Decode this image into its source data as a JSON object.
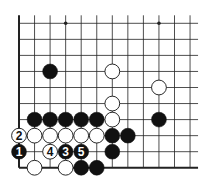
{
  "diagram": {
    "type": "go-board-fragment",
    "cols": 12,
    "rows": 10,
    "edges": {
      "left": true,
      "bottom": true,
      "top": false,
      "right": false
    },
    "hoshi": [
      {
        "col": 3,
        "row": 0
      },
      {
        "col": 9,
        "row": 0
      }
    ],
    "colors": {
      "line": "#222222",
      "black": "#111111",
      "white": "#ffffff",
      "background": "#ffffff"
    },
    "stones": [
      {
        "col": 2,
        "row": 3,
        "color": "black",
        "label": ""
      },
      {
        "col": 6,
        "row": 3,
        "color": "white",
        "label": ""
      },
      {
        "col": 9,
        "row": 4,
        "color": "white",
        "label": ""
      },
      {
        "col": 6,
        "row": 5,
        "color": "white",
        "label": ""
      },
      {
        "col": 1,
        "row": 6,
        "color": "black",
        "label": ""
      },
      {
        "col": 2,
        "row": 6,
        "color": "black",
        "label": ""
      },
      {
        "col": 3,
        "row": 6,
        "color": "black",
        "label": ""
      },
      {
        "col": 4,
        "row": 6,
        "color": "black",
        "label": ""
      },
      {
        "col": 5,
        "row": 6,
        "color": "black",
        "label": ""
      },
      {
        "col": 6,
        "row": 6,
        "color": "white",
        "label": ""
      },
      {
        "col": 9,
        "row": 6,
        "color": "black",
        "label": ""
      },
      {
        "col": 0,
        "row": 7,
        "color": "white",
        "label": "2"
      },
      {
        "col": 1,
        "row": 7,
        "color": "white",
        "label": ""
      },
      {
        "col": 2,
        "row": 7,
        "color": "white",
        "label": ""
      },
      {
        "col": 3,
        "row": 7,
        "color": "white",
        "label": ""
      },
      {
        "col": 4,
        "row": 7,
        "color": "white",
        "label": ""
      },
      {
        "col": 5,
        "row": 7,
        "color": "white",
        "label": ""
      },
      {
        "col": 6,
        "row": 7,
        "color": "black",
        "label": ""
      },
      {
        "col": 7,
        "row": 7,
        "color": "black",
        "label": ""
      },
      {
        "col": 0,
        "row": 8,
        "color": "black",
        "label": "1"
      },
      {
        "col": 2,
        "row": 8,
        "color": "white",
        "label": "4"
      },
      {
        "col": 3,
        "row": 8,
        "color": "black",
        "label": "3"
      },
      {
        "col": 4,
        "row": 8,
        "color": "black",
        "label": "5"
      },
      {
        "col": 6,
        "row": 8,
        "color": "black",
        "label": ""
      },
      {
        "col": 1,
        "row": 9,
        "color": "white",
        "label": ""
      },
      {
        "col": 3,
        "row": 9,
        "color": "white",
        "label": ""
      },
      {
        "col": 4,
        "row": 9,
        "color": "black",
        "label": ""
      },
      {
        "col": 5,
        "row": 9,
        "color": "black",
        "label": ""
      }
    ]
  }
}
